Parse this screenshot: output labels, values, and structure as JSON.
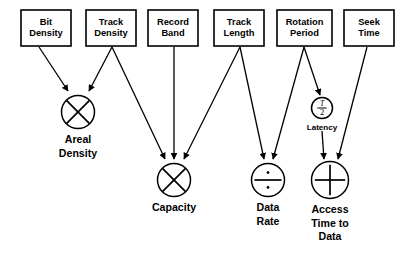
{
  "diagram": {
    "background_color": "#ffffff",
    "stroke_color": "#000000",
    "input_boxes": [
      {
        "id": "bit-density",
        "lines": [
          "Bit",
          "Density"
        ],
        "x": 21,
        "y": 10,
        "w": 50,
        "h": 36
      },
      {
        "id": "track-density",
        "lines": [
          "Track",
          "Density"
        ],
        "x": 86,
        "y": 10,
        "w": 50,
        "h": 36
      },
      {
        "id": "record-band",
        "lines": [
          "Record",
          "Band"
        ],
        "x": 148,
        "y": 10,
        "w": 50,
        "h": 36
      },
      {
        "id": "track-length",
        "lines": [
          "Track",
          "Length"
        ],
        "x": 214,
        "y": 10,
        "w": 50,
        "h": 36
      },
      {
        "id": "rotation-period",
        "lines": [
          "Rotation",
          "Period"
        ],
        "x": 277,
        "y": 10,
        "w": 55,
        "h": 36
      },
      {
        "id": "seek-time",
        "lines": [
          "Seek",
          "Time"
        ],
        "x": 344,
        "y": 10,
        "w": 50,
        "h": 36
      }
    ],
    "operator_nodes": [
      {
        "id": "areal-density",
        "operator": "multiply-icon",
        "cx": 78,
        "cy": 112,
        "r": 16.5,
        "label_lines": [
          "Areal",
          "Density"
        ]
      },
      {
        "id": "capacity",
        "operator": "multiply-icon",
        "cx": 174,
        "cy": 180,
        "r": 16.5,
        "label_lines": [
          "Capacity"
        ]
      },
      {
        "id": "data-rate",
        "operator": "divide-icon",
        "cx": 268,
        "cy": 180,
        "r": 16.5,
        "label_lines": [
          "Data",
          "Rate"
        ]
      },
      {
        "id": "access-time",
        "operator": "plus-icon",
        "cx": 330,
        "cy": 180,
        "r": 18.5,
        "label_lines": [
          "Access",
          "Time to",
          "Data"
        ]
      }
    ],
    "latency_node": {
      "id": "latency",
      "cx": 322,
      "cy": 108,
      "r": 10.5,
      "numerator": "T",
      "denominator": "2",
      "label": "Latency"
    },
    "edges": [
      {
        "id": "edge-bit-density-to-areal-density",
        "from": "bit-density",
        "to": "areal-density",
        "x1": 39,
        "y1": 47,
        "x2": 68,
        "y2": 91
      },
      {
        "id": "edge-track-density-to-areal-density",
        "from": "track-density",
        "to": "areal-density",
        "x1": 112,
        "y1": 47,
        "x2": 89,
        "y2": 91
      },
      {
        "id": "edge-track-density-to-capacity",
        "from": "track-density",
        "to": "capacity",
        "x1": 112,
        "y1": 47,
        "x2": 165,
        "y2": 159
      },
      {
        "id": "edge-record-band-to-capacity",
        "from": "record-band",
        "to": "capacity",
        "x1": 174,
        "y1": 47,
        "x2": 174,
        "y2": 159
      },
      {
        "id": "edge-track-length-to-capacity",
        "from": "track-length",
        "to": "capacity",
        "x1": 240,
        "y1": 47,
        "x2": 184,
        "y2": 159
      },
      {
        "id": "edge-track-length-to-data-rate",
        "from": "track-length",
        "to": "data-rate",
        "x1": 240,
        "y1": 47,
        "x2": 264,
        "y2": 159
      },
      {
        "id": "edge-rotation-period-to-data-rate",
        "from": "rotation-period",
        "to": "data-rate",
        "x1": 304,
        "y1": 47,
        "x2": 273,
        "y2": 159
      },
      {
        "id": "edge-rotation-period-to-latency",
        "from": "rotation-period",
        "to": "latency",
        "x1": 304,
        "y1": 47,
        "x2": 320,
        "y2": 95
      },
      {
        "id": "edge-latency-to-access-time",
        "from": "latency",
        "to": "access-time",
        "x1": 322,
        "y1": 131,
        "x2": 324,
        "y2": 159
      },
      {
        "id": "edge-seek-time-to-access-time",
        "from": "seek-time",
        "to": "access-time",
        "x1": 367,
        "y1": 47,
        "x2": 338,
        "y2": 159
      }
    ]
  }
}
